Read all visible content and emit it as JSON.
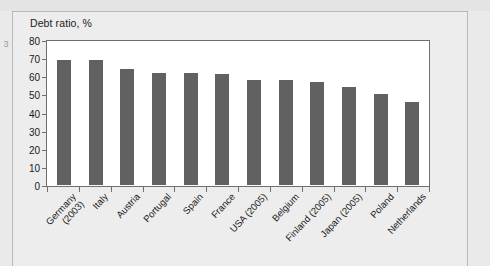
{
  "page": {
    "left_margin_glyph": "3"
  },
  "chart_data": {
    "type": "bar",
    "title": "Debt ratio, %",
    "xlabel": "",
    "ylabel": "",
    "ylim": [
      0,
      80
    ],
    "ytick_step": 10,
    "ytick_labels": [
      "80",
      "70",
      "60",
      "50",
      "40",
      "30",
      "20",
      "10",
      "0"
    ],
    "grid": false,
    "legend": false,
    "bar_color": "#616161",
    "plot_background": "#ffffff",
    "frame_background": "#ededed",
    "categories": [
      "Germany (2003)",
      "Italy",
      "Austria",
      "Portugal",
      "Spain",
      "France",
      "USA (2005)",
      "Belgium",
      "Finland (2005)",
      "Japan (2005)",
      "Poland",
      "Netherlands"
    ],
    "category_lines": [
      [
        "Germany",
        "(2003)"
      ],
      [
        "Italy"
      ],
      [
        "Austria"
      ],
      [
        "Portugal"
      ],
      [
        "Spain"
      ],
      [
        "France"
      ],
      [
        "USA (2005)"
      ],
      [
        "Belgium"
      ],
      [
        "Finland (2005)"
      ],
      [
        "Japan (2005)"
      ],
      [
        "Poland"
      ],
      [
        "Netherlands"
      ]
    ],
    "values": [
      69,
      69,
      64,
      62,
      62,
      61,
      58,
      58,
      57,
      54,
      50,
      46
    ]
  }
}
